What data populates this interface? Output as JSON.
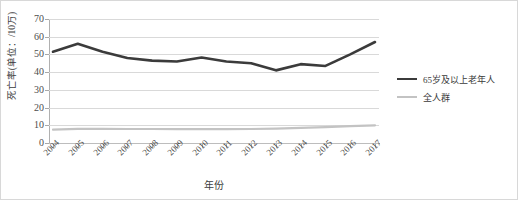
{
  "chart_data": {
    "type": "line",
    "title": "",
    "xlabel": "年份",
    "ylabel": "死亡率(单位：/10万)",
    "categories": [
      "2004",
      "2005",
      "2006",
      "2007",
      "2008",
      "2009",
      "2010",
      "2011",
      "2012",
      "2013",
      "2014",
      "2015",
      "2016",
      "2017"
    ],
    "ylim": [
      0,
      70
    ],
    "ytick_labels": [
      "0",
      "10",
      "20",
      "30",
      "40",
      "50",
      "60",
      "70"
    ],
    "ytick_values": [
      0,
      10,
      20,
      30,
      40,
      50,
      60,
      70
    ],
    "grid": "horizontal",
    "legend_position": "right",
    "series": [
      {
        "name": "65岁及以上老年人",
        "color": "#3b3b3b",
        "width": 2.6,
        "values": [
          51.5,
          56.0,
          51.5,
          48.0,
          46.5,
          46.0,
          48.3,
          46.0,
          45.0,
          41.0,
          44.5,
          43.5,
          50.0,
          57.0
        ]
      },
      {
        "name": "全人群",
        "color": "#c3c3c3",
        "width": 2.2,
        "values": [
          7.5,
          8.0,
          8.0,
          7.9,
          7.9,
          7.8,
          7.8,
          7.8,
          7.9,
          8.1,
          8.5,
          9.0,
          9.5,
          10.0
        ]
      }
    ],
    "series_full": [
      {
        "name": "65岁及以上老年人",
        "values": [
          51.5,
          56.0,
          51.5,
          48.0,
          46.5,
          46.0,
          48.3,
          46.0,
          45.0,
          41.0,
          44.5,
          43.5,
          50.0,
          57.0,
          58.0,
          62.5
        ]
      }
    ]
  },
  "legend": {
    "items": [
      {
        "label": "65岁及以上老年人",
        "color": "#3b3b3b",
        "thickness": "2.6px"
      },
      {
        "label": "全人群",
        "color": "#c3c3c3",
        "thickness": "2.2px"
      }
    ]
  },
  "axes": {
    "x_title": "年份",
    "y_title": "死亡率(单位：/10万)"
  }
}
